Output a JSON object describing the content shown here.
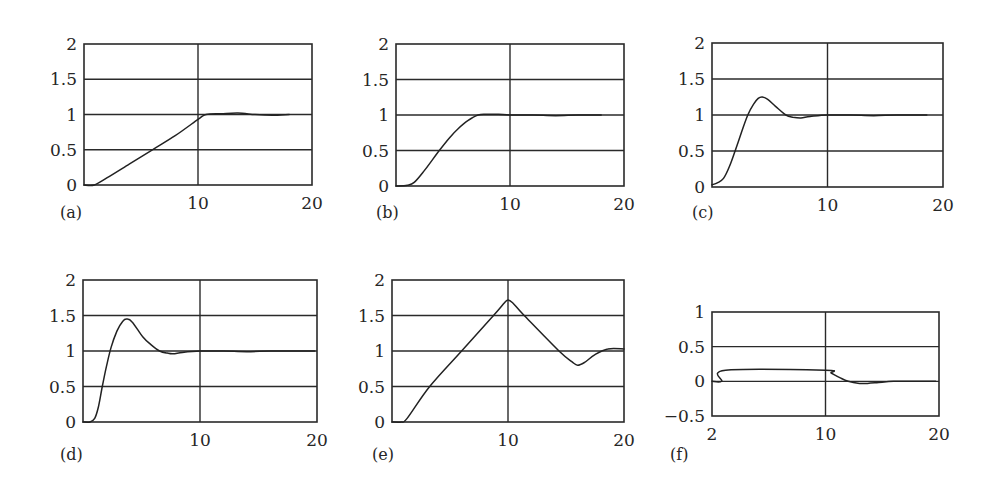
{
  "chart_data": [
    {
      "type": "line",
      "panel": "(a)",
      "xlim": [
        0,
        20
      ],
      "ylim": [
        0,
        2
      ],
      "xticks": [
        10,
        20
      ],
      "xtick_labels": [
        "10",
        "20"
      ],
      "yticks": [
        0,
        0.5,
        1,
        1.5,
        2
      ],
      "ytick_labels": [
        "0",
        "0.5",
        "1",
        "1.5",
        "2"
      ],
      "grid": true,
      "series": [
        {
          "name": "response",
          "x": [
            0,
            0.9,
            2,
            4,
            6,
            8,
            10,
            10.7,
            12,
            13.5,
            15,
            16.5,
            18
          ],
          "y": [
            0,
            0,
            0.1,
            0.3,
            0.5,
            0.7,
            0.93,
            1.0,
            1.01,
            1.02,
            1.0,
            0.99,
            1.0
          ]
        }
      ]
    },
    {
      "type": "line",
      "panel": "(b)",
      "xlim": [
        0,
        20
      ],
      "ylim": [
        0,
        2
      ],
      "xticks": [
        10,
        20
      ],
      "xtick_labels": [
        "10",
        "20"
      ],
      "yticks": [
        0,
        0.5,
        1,
        1.5,
        2
      ],
      "ytick_labels": [
        "0",
        "0.5",
        "1",
        "1.5",
        "2"
      ],
      "grid": true,
      "series": [
        {
          "name": "response",
          "x": [
            0,
            1,
            1.6,
            2.5,
            3.8,
            4.7,
            5.4,
            6.3,
            7.2,
            8,
            9,
            10,
            12,
            14,
            16,
            18
          ],
          "y": [
            0,
            0.01,
            0.05,
            0.22,
            0.5,
            0.68,
            0.8,
            0.92,
            1.0,
            1.01,
            1.01,
            1.0,
            1.0,
            0.99,
            1.0,
            1.0
          ]
        }
      ]
    },
    {
      "type": "line",
      "panel": "(c)",
      "xlim": [
        0,
        20
      ],
      "ylim": [
        0,
        2
      ],
      "xticks": [
        10,
        20
      ],
      "xtick_labels": [
        "10",
        "20"
      ],
      "yticks": [
        0,
        0.5,
        1,
        1.5,
        2
      ],
      "ytick_labels": [
        "0",
        "0.5",
        "1",
        "1.5",
        "2"
      ],
      "grid": true,
      "series": [
        {
          "name": "response",
          "x": [
            0,
            0.5,
            1,
            1.5,
            2,
            2.6,
            3.1,
            3.6,
            4,
            4.35,
            4.8,
            5.5,
            6.4,
            7,
            7.7,
            8.5,
            10,
            12,
            14,
            16,
            18.6
          ],
          "y": [
            0.03,
            0.06,
            0.12,
            0.28,
            0.5,
            0.78,
            1.0,
            1.15,
            1.23,
            1.25,
            1.22,
            1.12,
            1.0,
            0.97,
            0.96,
            0.98,
            1.0,
            1.0,
            0.99,
            1.0,
            1.0
          ]
        }
      ]
    },
    {
      "type": "line",
      "panel": "(d)",
      "xlim": [
        0,
        20
      ],
      "ylim": [
        0,
        2
      ],
      "xticks": [
        10,
        20
      ],
      "xtick_labels": [
        "10",
        "20"
      ],
      "yticks": [
        0,
        0.5,
        1,
        1.5,
        2
      ],
      "ytick_labels": [
        "0",
        "0.5",
        "1",
        "1.5",
        "2"
      ],
      "grid": true,
      "series": [
        {
          "name": "response",
          "x": [
            0,
            0.6,
            1.0,
            1.3,
            1.65,
            2.0,
            2.4,
            2.9,
            3.4,
            3.75,
            4.2,
            5.1,
            5.8,
            6.55,
            7.2,
            7.7,
            8.5,
            10,
            12,
            14,
            16,
            18,
            19.8
          ],
          "y": [
            0,
            0,
            0.05,
            0.2,
            0.5,
            0.78,
            1.05,
            1.28,
            1.42,
            1.45,
            1.41,
            1.2,
            1.09,
            1.0,
            0.97,
            0.96,
            0.98,
            1.0,
            1.0,
            0.99,
            1.0,
            1.0,
            1.0
          ]
        }
      ]
    },
    {
      "type": "line",
      "panel": "(e)",
      "xlim": [
        0,
        20
      ],
      "ylim": [
        0,
        2
      ],
      "xticks": [
        10,
        20
      ],
      "xtick_labels": [
        "10",
        "20"
      ],
      "yticks": [
        0,
        0.5,
        1,
        1.5,
        2
      ],
      "ytick_labels": [
        "0",
        "0.5",
        "1",
        "1.5",
        "2"
      ],
      "grid": true,
      "series": [
        {
          "name": "response",
          "x": [
            0,
            0.8,
            1.3,
            3.25,
            6.0,
            8.75,
            9.7,
            10.0,
            10.4,
            11.4,
            14.4,
            15.5,
            16.0,
            16.6,
            17.5,
            18.6,
            20
          ],
          "y": [
            0,
            0,
            0.05,
            0.5,
            1.0,
            1.5,
            1.68,
            1.72,
            1.68,
            1.5,
            1.0,
            0.85,
            0.8,
            0.84,
            0.95,
            1.03,
            1.03
          ]
        }
      ]
    },
    {
      "type": "line",
      "panel": "(f)",
      "xlim": [
        0,
        20
      ],
      "ylim": [
        -0.5,
        1
      ],
      "xticks": [
        0,
        10,
        20
      ],
      "xtick_labels": [
        "2",
        "10",
        "20"
      ],
      "yticks": [
        -0.5,
        0,
        0.5,
        1
      ],
      "ytick_labels": [
        "−0.5",
        "0",
        "0.5",
        "1"
      ],
      "grid": true,
      "series": [
        {
          "name": "error",
          "x": [
            0,
            0.85,
            1.2,
            10,
            10.5,
            11.3,
            12,
            13,
            13.7,
            14.5,
            16,
            18,
            19.7
          ],
          "y": [
            0,
            0,
            0.16,
            0.16,
            0.12,
            0.05,
            0.0,
            -0.03,
            -0.03,
            -0.02,
            0.0,
            0.0,
            0.0
          ]
        }
      ]
    }
  ]
}
